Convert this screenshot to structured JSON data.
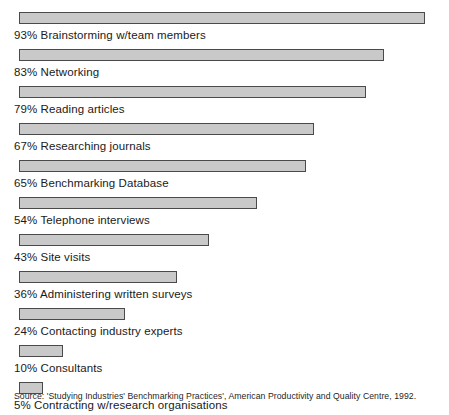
{
  "chart_data": {
    "type": "bar",
    "orientation": "horizontal",
    "title": "",
    "subtitle": "",
    "xlabel": "",
    "ylabel": "",
    "xlim": [
      0,
      100
    ],
    "grid": false,
    "legend": null,
    "value_suffix": "%",
    "categories": [
      "Brainstorming w/team members",
      "Networking",
      "Reading articles",
      "Researching journals",
      "Benchmarking Database",
      "Telephone interviews",
      "Site visits",
      "Administering written surveys",
      "Contacting industry experts",
      "Consultants",
      "Contracting w/research organisations"
    ],
    "values": [
      93,
      83,
      79,
      67,
      65,
      54,
      43,
      36,
      24,
      10,
      5
    ],
    "bars": [
      {
        "value": 93,
        "value_label": "93%",
        "category": "Brainstorming w/team members",
        "label": "93% Brainstorming w/team members",
        "bar_width_px": 406
      },
      {
        "value": 83,
        "value_label": "83%",
        "category": "Networking",
        "label": "83% Networking",
        "bar_width_px": 365
      },
      {
        "value": 79,
        "value_label": "79%",
        "category": "Reading articles",
        "label": "79% Reading articles",
        "bar_width_px": 347
      },
      {
        "value": 67,
        "value_label": "67%",
        "category": "Researching journals",
        "label": "67% Researching journals",
        "bar_width_px": 295
      },
      {
        "value": 65,
        "value_label": "65%",
        "category": "Benchmarking Database",
        "label": "65% Benchmarking Database",
        "bar_width_px": 287
      },
      {
        "value": 54,
        "value_label": "54%",
        "category": "Telephone interviews",
        "label": "54% Telephone interviews",
        "bar_width_px": 238
      },
      {
        "value": 43,
        "value_label": "43%",
        "category": "Site visits",
        "label": "43% Site visits",
        "bar_width_px": 190
      },
      {
        "value": 36,
        "value_label": "36%",
        "category": "Administering written surveys",
        "label": "36% Administering written surveys",
        "bar_width_px": 158
      },
      {
        "value": 24,
        "value_label": "24%",
        "category": "Contacting industry experts",
        "label": "24% Contacting industry experts",
        "bar_width_px": 106
      },
      {
        "value": 10,
        "value_label": "10%",
        "category": "Consultants",
        "label": "10% Consultants",
        "bar_width_px": 44
      },
      {
        "value": 5,
        "value_label": "5%",
        "category": "Contracting w/research organisations",
        "label": "5% Contracting w/research organisations",
        "bar_width_px": 24
      }
    ],
    "colors": {
      "bar_fill": "#c9c9c9",
      "bar_border": "#4a4a4a",
      "background": "#ffffff",
      "text": "#1a1a1a"
    }
  },
  "source": {
    "text": "Source: 'Studying Industries' Benchmarking Practices', American Productivity and Quality Centre, 1992."
  }
}
